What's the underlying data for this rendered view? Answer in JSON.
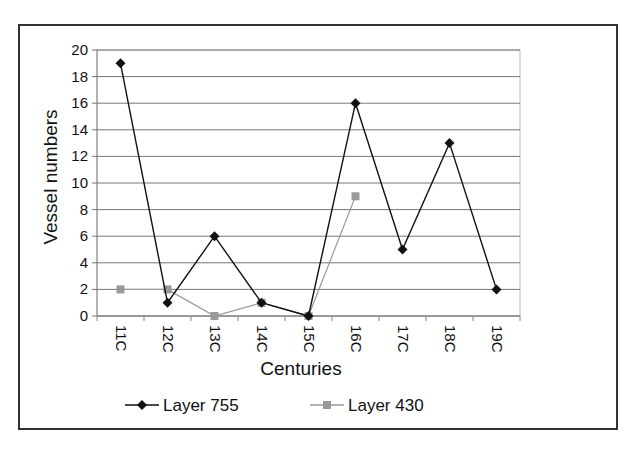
{
  "chart_data": {
    "type": "line",
    "title": "",
    "xlabel": "Centuries",
    "ylabel": "Vessel numbers",
    "categories": [
      "11C",
      "12C",
      "13C",
      "14C",
      "15C",
      "16C",
      "17C",
      "18C",
      "19C"
    ],
    "ylim": [
      0,
      20
    ],
    "yticks": [
      0,
      2,
      4,
      6,
      8,
      10,
      12,
      14,
      16,
      18,
      20
    ],
    "grid": true,
    "legend_position": "bottom",
    "series": [
      {
        "name": "Layer 755",
        "color": "#111111",
        "marker": "diamond",
        "values": [
          19,
          1,
          6,
          1,
          0,
          16,
          5,
          13,
          2
        ]
      },
      {
        "name": "Layer 430",
        "color": "#999999",
        "marker": "square",
        "values": [
          2,
          2,
          0,
          1,
          0,
          9,
          null,
          null,
          null
        ]
      }
    ]
  }
}
